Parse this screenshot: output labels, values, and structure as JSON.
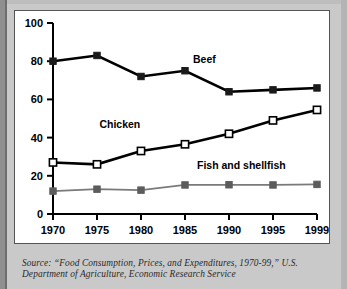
{
  "figure": {
    "background_color": "#c9c9c9",
    "panel_color": "#ffffff"
  },
  "source": {
    "line1": "Source: “Food Consumption, Prices, and Expenditures, 1970-99,” U.S.",
    "line2": "Department of Agriculture, Economic Research Service"
  },
  "chart_data": {
    "type": "line",
    "title": "",
    "subtitle": "",
    "xlabel": "",
    "ylabel": "",
    "categories": [
      "1970",
      "1975",
      "1980",
      "1985",
      "1990",
      "1995",
      "1999"
    ],
    "x": [
      1970,
      1975,
      1980,
      1985,
      1990,
      1995,
      1999
    ],
    "ylim": [
      0,
      100
    ],
    "yticks": [
      0,
      20,
      40,
      60,
      80,
      100
    ],
    "yticklabels": [
      "0",
      "20",
      "40",
      "60",
      "80",
      "100"
    ],
    "grid": false,
    "legend_position": "inline-annotations",
    "series": [
      {
        "name": "Beef",
        "values": [
          80,
          83,
          72,
          75,
          64,
          65,
          66
        ],
        "color": "#000000",
        "marker": "filled-square",
        "marker_color": "#1a1a1a",
        "line_width": 2.6,
        "label_x": 1987.2,
        "label_y": 79
      },
      {
        "name": "Chicken",
        "values": [
          27,
          26,
          33,
          36.5,
          42,
          49,
          54.5
        ],
        "color": "#000000",
        "marker": "open-square",
        "marker_color": "#ffffff",
        "line_width": 2.6,
        "label_x": 1977.6,
        "label_y": 45
      },
      {
        "name": "Fish and shellfish",
        "values": [
          12,
          13,
          12.5,
          15.2,
          15.3,
          15.2,
          15.5
        ],
        "color": "#7a7a7a",
        "marker": "filled-square",
        "marker_color": "#5c5c5c",
        "line_width": 1.7,
        "label_x": 1991.4,
        "label_y": 23.5
      }
    ]
  }
}
